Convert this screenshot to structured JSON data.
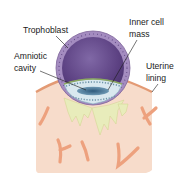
{
  "labels": {
    "trophoblast": "Trophoblast",
    "inner_cell_mass_line1": "Inner cell",
    "inner_cell_mass_line2": "mass",
    "amniotic_line1": "Amniotic",
    "amniotic_line2": "cavity",
    "uterine_line1": "Uterine",
    "uterine_line2": "lining"
  },
  "colors": {
    "background": "#ffffff",
    "blastocyst_cavity": "#6a4d8e",
    "trophoblast_ring": "#a48cc0",
    "trophoblast_dots": "#5e4682",
    "inner_cell_mass": "#d8e8ee",
    "inner_cell_outline": "#7fa8bc",
    "amniotic_cavity": "#4f7896",
    "green_layer": "#8ca860",
    "uterine_tissue": "#f7dccb",
    "uterine_edge": "#e8a07a",
    "blood_vessels": "#eda17e",
    "glands": "#e9edbd",
    "leader_lines": "#1a1a1a"
  }
}
